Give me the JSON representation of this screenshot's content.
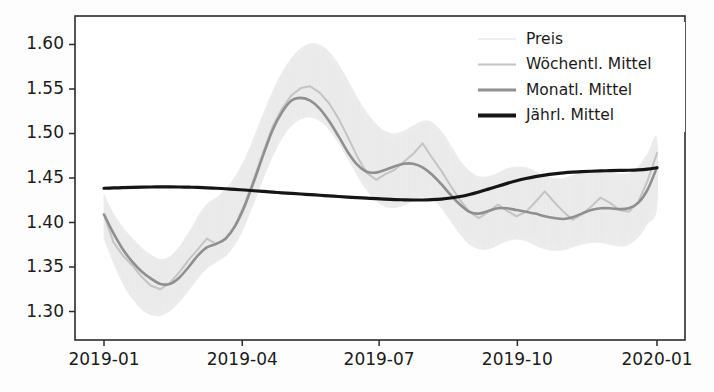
{
  "figure": {
    "background": "#fdfdfd",
    "plot_background": "#ffffff"
  },
  "chart_data": {
    "type": "line",
    "title": "",
    "xlabel": "",
    "ylabel": "",
    "xlim": [
      "2018-12-24",
      "2020-01-07"
    ],
    "ylim": [
      1.268,
      1.632
    ],
    "yticks": [
      1.3,
      1.35,
      1.4,
      1.45,
      1.5,
      1.55,
      1.6
    ],
    "ytick_labels": [
      "1.30",
      "1.35",
      "1.40",
      "1.45",
      "1.50",
      "1.55",
      "1.60"
    ],
    "xticks": [
      "2019-01",
      "2019-04",
      "2019-07",
      "2019-10",
      "2020-01"
    ],
    "xtick_labels": [
      "2019-01",
      "2019-04",
      "2019-07",
      "2019-10",
      "2020-01"
    ],
    "grid": false,
    "legend_position": "upper right",
    "x_fraction": [
      0.0,
      0.017,
      0.034,
      0.051,
      0.068,
      0.085,
      0.102,
      0.119,
      0.136,
      0.153,
      0.17,
      0.186,
      0.203,
      0.22,
      0.237,
      0.254,
      0.271,
      0.288,
      0.305,
      0.322,
      0.339,
      0.356,
      0.373,
      0.39,
      0.407,
      0.424,
      0.441,
      0.458,
      0.475,
      0.492,
      0.508,
      0.525,
      0.542,
      0.559,
      0.576,
      0.593,
      0.61,
      0.627,
      0.644,
      0.661,
      0.678,
      0.695,
      0.712,
      0.729,
      0.746,
      0.763,
      0.78,
      0.797,
      0.814,
      0.831,
      0.847,
      0.864,
      0.881,
      0.898,
      0.915,
      0.932,
      0.949,
      0.966,
      0.983,
      1.0
    ],
    "series": [
      {
        "name": "Preis",
        "color": "#e9e9e9",
        "linewidth": 1.0,
        "role": "raw-envelope",
        "upper": [
          1.432,
          1.411,
          1.395,
          1.383,
          1.372,
          1.364,
          1.359,
          1.362,
          1.373,
          1.389,
          1.407,
          1.421,
          1.428,
          1.438,
          1.452,
          1.471,
          1.496,
          1.523,
          1.548,
          1.569,
          1.585,
          1.596,
          1.601,
          1.6,
          1.592,
          1.578,
          1.56,
          1.541,
          1.524,
          1.511,
          1.503,
          1.5,
          1.503,
          1.509,
          1.514,
          1.513,
          1.503,
          1.487,
          1.47,
          1.458,
          1.452,
          1.452,
          1.456,
          1.461,
          1.463,
          1.462,
          1.458,
          1.453,
          1.45,
          1.45,
          1.453,
          1.457,
          1.459,
          1.459,
          1.457,
          1.455,
          1.456,
          1.463,
          1.478,
          1.495
        ],
        "lower": [
          1.381,
          1.354,
          1.331,
          1.314,
          1.302,
          1.296,
          1.295,
          1.3,
          1.31,
          1.323,
          1.337,
          1.348,
          1.355,
          1.362,
          1.375,
          1.395,
          1.421,
          1.449,
          1.474,
          1.494,
          1.508,
          1.516,
          1.518,
          1.514,
          1.504,
          1.489,
          1.471,
          1.452,
          1.436,
          1.424,
          1.418,
          1.416,
          1.419,
          1.424,
          1.428,
          1.426,
          1.416,
          1.401,
          1.386,
          1.375,
          1.37,
          1.37,
          1.374,
          1.379,
          1.381,
          1.379,
          1.374,
          1.37,
          1.368,
          1.369,
          1.372,
          1.375,
          1.377,
          1.377,
          1.375,
          1.373,
          1.375,
          1.383,
          1.398,
          1.416
        ]
      },
      {
        "name": "Wöchentl. Mittel",
        "color": "#c4c4c4",
        "linewidth": 2.0,
        "role": "weekly-mean",
        "values": [
          1.409,
          1.378,
          1.363,
          1.352,
          1.339,
          1.329,
          1.325,
          1.332,
          1.344,
          1.358,
          1.37,
          1.382,
          1.376,
          1.381,
          1.397,
          1.42,
          1.449,
          1.479,
          1.508,
          1.528,
          1.543,
          1.551,
          1.553,
          1.546,
          1.534,
          1.517,
          1.496,
          1.474,
          1.456,
          1.448,
          1.454,
          1.459,
          1.468,
          1.477,
          1.489,
          1.473,
          1.458,
          1.441,
          1.425,
          1.412,
          1.405,
          1.412,
          1.42,
          1.413,
          1.407,
          1.412,
          1.423,
          1.435,
          1.423,
          1.412,
          1.403,
          1.409,
          1.418,
          1.428,
          1.422,
          1.414,
          1.412,
          1.423,
          1.447,
          1.478
        ]
      },
      {
        "name": "Monatl. Mittel",
        "color": "#8f8f8f",
        "linewidth": 2.6,
        "role": "monthly-mean",
        "values": [
          1.409,
          1.388,
          1.37,
          1.356,
          1.345,
          1.337,
          1.331,
          1.331,
          1.338,
          1.35,
          1.363,
          1.372,
          1.376,
          1.382,
          1.396,
          1.418,
          1.446,
          1.476,
          1.504,
          1.524,
          1.537,
          1.54,
          1.537,
          1.528,
          1.514,
          1.497,
          1.479,
          1.465,
          1.457,
          1.456,
          1.459,
          1.463,
          1.466,
          1.466,
          1.462,
          1.454,
          1.443,
          1.431,
          1.42,
          1.412,
          1.41,
          1.413,
          1.416,
          1.416,
          1.414,
          1.412,
          1.41,
          1.407,
          1.405,
          1.404,
          1.406,
          1.41,
          1.414,
          1.416,
          1.416,
          1.415,
          1.416,
          1.422,
          1.437,
          1.462
        ]
      },
      {
        "name": "Jährl. Mittel",
        "color": "#151515",
        "linewidth": 3.2,
        "role": "yearly-mean",
        "values": [
          1.4385,
          1.4388,
          1.4391,
          1.4394,
          1.4397,
          1.4399,
          1.44,
          1.44,
          1.4399,
          1.4397,
          1.4394,
          1.439,
          1.4385,
          1.4379,
          1.4372,
          1.4365,
          1.4357,
          1.4349,
          1.4341,
          1.4334,
          1.4327,
          1.432,
          1.4313,
          1.4306,
          1.4299,
          1.4292,
          1.4285,
          1.4279,
          1.4273,
          1.4268,
          1.4263,
          1.4258,
          1.4255,
          1.4253,
          1.4253,
          1.4256,
          1.4263,
          1.4275,
          1.4292,
          1.4315,
          1.4343,
          1.4375,
          1.4408,
          1.444,
          1.4469,
          1.4494,
          1.4515,
          1.4532,
          1.4546,
          1.4557,
          1.4565,
          1.4571,
          1.4576,
          1.458,
          1.4583,
          1.4585,
          1.4587,
          1.4591,
          1.46,
          1.4615
        ]
      }
    ]
  },
  "legend": {
    "entries": [
      {
        "label": "Preis",
        "color": "#e9e9e9",
        "linewidth": 1.4
      },
      {
        "label": "Wöchentl. Mittel",
        "color": "#c4c4c4",
        "linewidth": 2.0
      },
      {
        "label": "Monatl. Mittel",
        "color": "#8f8f8f",
        "linewidth": 3.0
      },
      {
        "label": "Jährl. Mittel",
        "color": "#151515",
        "linewidth": 4.0
      }
    ]
  }
}
